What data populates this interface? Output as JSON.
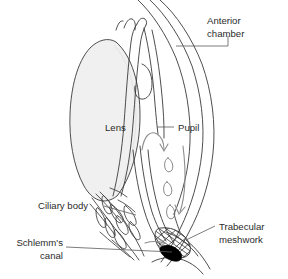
{
  "figure": {
    "kind": "anatomical-diagram",
    "background_color": "#ffffff",
    "line_color": "#3a3a3a",
    "lens_fill_color": "#f0f0f0",
    "schlemm_fill_color": "#000000",
    "width": 288,
    "height": 279
  },
  "labels": {
    "anterior_chamber": {
      "line1": "Anterior",
      "line2": "chamber"
    },
    "lens": "Lens",
    "pupil": "Pupil",
    "ciliary_body": "Ciliary body",
    "schlemms_canal": {
      "line1": "Schlemm's",
      "line2": "canal"
    },
    "trabecular_meshwork": {
      "line1": "Trabecular",
      "line2": "meshwork"
    }
  },
  "structures": [
    {
      "name": "cornea",
      "description": "outer anterior curved double line"
    },
    {
      "name": "sclera",
      "description": "outer globe wall curve"
    },
    {
      "name": "anterior-chamber",
      "description": "space between cornea and iris"
    },
    {
      "name": "lens",
      "description": "central shaded lenticular body"
    },
    {
      "name": "iris",
      "description": "diaphragm anterior to lens with pupil aperture"
    },
    {
      "name": "pupil",
      "description": "central aperture of iris"
    },
    {
      "name": "ciliary-body",
      "description": "ciliary processes posterior to iris root"
    },
    {
      "name": "trabecular-meshwork",
      "description": "cross-hatched drainage tissue at angle"
    },
    {
      "name": "schlemms-canal",
      "description": "black filled channel beside trabecular meshwork"
    },
    {
      "name": "aqueous-flow-arrows",
      "description": "curved arrows showing aqueous humour outflow path"
    },
    {
      "name": "aqueous-flow-droplets",
      "description": "teardrop marks along the outflow path"
    }
  ]
}
